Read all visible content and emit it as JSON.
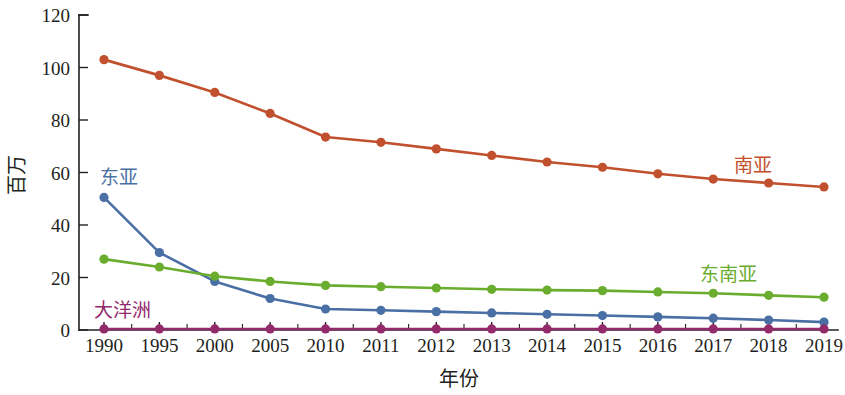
{
  "chart_data": {
    "type": "line",
    "title": "",
    "subtitle": "",
    "xlabel": "年份",
    "ylabel": "百万",
    "categories": [
      "1990",
      "1995",
      "2000",
      "2005",
      "2010",
      "2011",
      "2012",
      "2013",
      "2014",
      "2015",
      "2016",
      "2017",
      "2018",
      "2019"
    ],
    "xlim": [
      0,
      13
    ],
    "ylim": [
      0,
      120
    ],
    "yticks": [
      0,
      20,
      40,
      60,
      80,
      100,
      120
    ],
    "grid": false,
    "legend_position": "inline-annotations",
    "series": [
      {
        "name": "南亚",
        "color": "#c1502e",
        "label_x": 2019,
        "values": [
          103,
          97,
          90.5,
          82.5,
          73.5,
          71.5,
          69,
          66.5,
          64,
          62,
          59.5,
          57.5,
          56,
          54.5
        ]
      },
      {
        "name": "东亚",
        "color": "#4a6fa5",
        "label_x": 1990,
        "values": [
          50.5,
          29.5,
          18.5,
          12,
          8,
          7.5,
          7,
          6.5,
          6,
          5.5,
          5,
          4.5,
          3.8,
          3
        ]
      },
      {
        "name": "东南亚",
        "color": "#6aad2e",
        "label_x": 2018,
        "values": [
          27,
          24,
          20.5,
          18.5,
          17,
          16.5,
          16,
          15.5,
          15.2,
          15,
          14.5,
          14,
          13.2,
          12.5
        ]
      },
      {
        "name": "大洋洲",
        "color": "#932a6b",
        "label_x": 1990,
        "values": [
          0.4,
          0.4,
          0.4,
          0.4,
          0.4,
          0.4,
          0.4,
          0.4,
          0.4,
          0.4,
          0.4,
          0.4,
          0.4,
          0.4
        ]
      }
    ],
    "annotations": [
      {
        "text": "东亚",
        "color": "#4a6fa5",
        "x": 100,
        "y": 184
      },
      {
        "text": "大洋洲",
        "color": "#932a6b",
        "x": 94,
        "y": 317
      },
      {
        "text": "南亚",
        "color": "#c1502e",
        "x": 734,
        "y": 172
      },
      {
        "text": "东南亚",
        "color": "#6aad2e",
        "x": 700,
        "y": 281
      }
    ]
  },
  "axes": {
    "y_tick_labels": [
      "120",
      "100",
      "80",
      "60",
      "40",
      "20",
      "0"
    ],
    "x_tick_labels": [
      "1990",
      "1995",
      "2000",
      "2005",
      "2010",
      "2011",
      "2012",
      "2013",
      "2014",
      "2015",
      "2016",
      "2017",
      "2018",
      "2019"
    ],
    "y_axis_title": "百万",
    "x_axis_title": "年份"
  },
  "colors": {
    "south_asia": "#c1502e",
    "east_asia": "#4a6fa5",
    "southeast_asia": "#6aad2e",
    "oceania": "#932a6b",
    "axis": "#231f20",
    "background": "#ffffff"
  }
}
